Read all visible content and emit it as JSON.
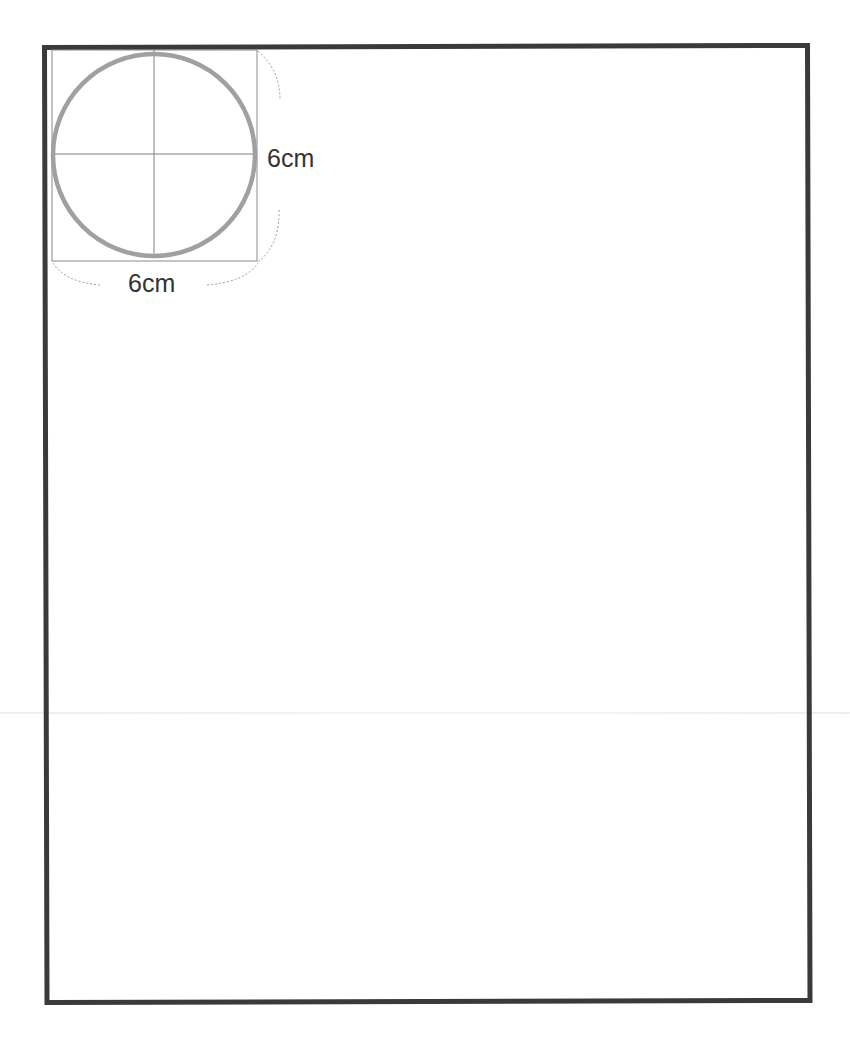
{
  "page": {
    "title_visible": false,
    "colors": {
      "frame": "#3a3a3a",
      "circle": "#a0a0a0",
      "guides": "#808080",
      "dimension_arc": "#9a9a9a",
      "label": "#333333"
    }
  },
  "diagram": {
    "shape": "circle",
    "circle_diameter": "6cm",
    "bounding_square": {
      "width": "6cm",
      "height": "6cm"
    },
    "labels": {
      "right": "6cm",
      "bottom": "6cm"
    },
    "crosshair": true
  }
}
